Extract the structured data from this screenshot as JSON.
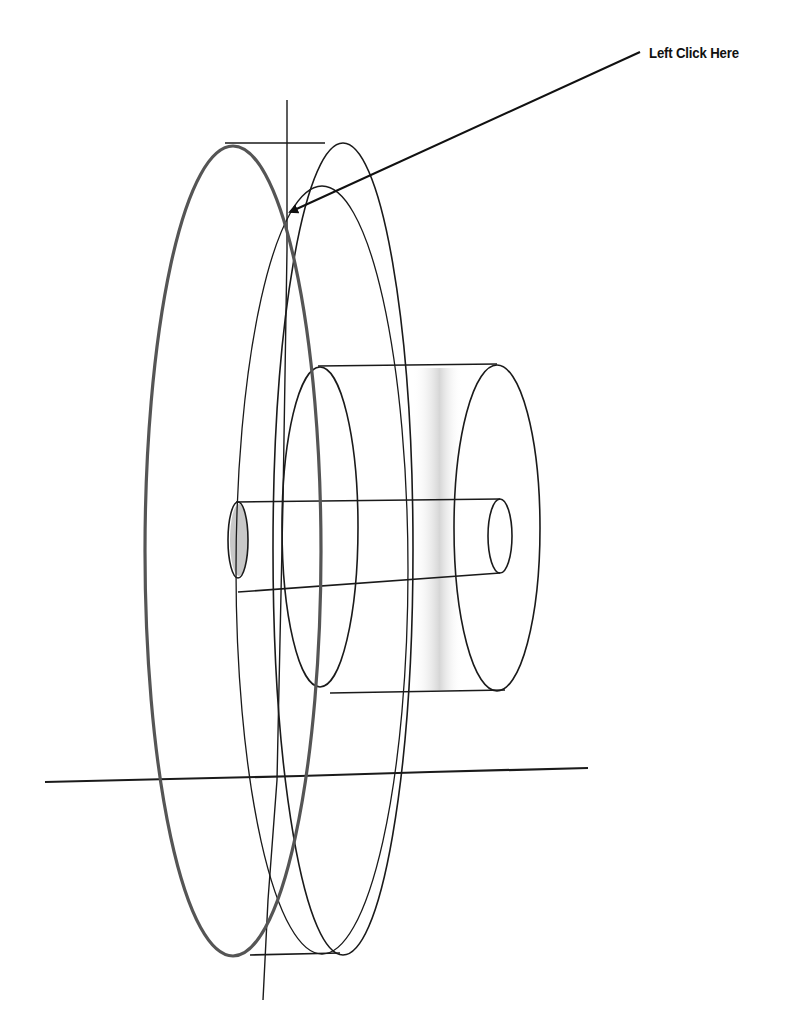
{
  "callout": {
    "label": "Left Click Here",
    "arrow": {
      "from": [
        640,
        52
      ],
      "to": [
        287,
        213
      ]
    }
  },
  "colors": {
    "line": "#1a1a1a",
    "highlighted_edge": "#555555",
    "shading": "#cfcfcf",
    "background": "#ffffff"
  },
  "model": {
    "type": "wireframe",
    "parts": [
      {
        "name": "disk",
        "front_edge_highlighted": true
      },
      {
        "name": "hub-cylinder"
      },
      {
        "name": "shaft"
      }
    ],
    "axes": [
      "vertical-axis",
      "horizontal-axis"
    ]
  }
}
